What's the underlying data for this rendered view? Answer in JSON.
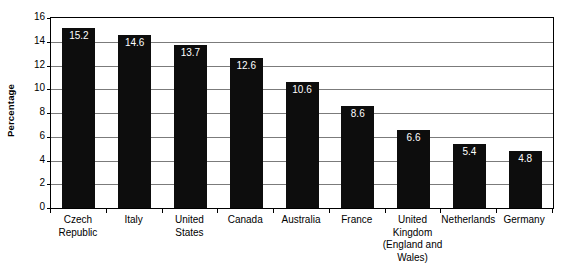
{
  "chart_data": {
    "type": "bar",
    "title": "",
    "subtitle": "",
    "xlabel": "",
    "ylabel": "Percentage",
    "ylim": [
      0,
      16
    ],
    "ytick_step": 2,
    "grid": true,
    "legend": "none",
    "orientation": "vertical",
    "categories": [
      "Czech Republic",
      "Italy",
      "United States",
      "Canada",
      "Australia",
      "France",
      "United Kingdom (England and Wales)",
      "Netherlands",
      "Germany"
    ],
    "values": [
      15.2,
      14.6,
      13.7,
      12.6,
      10.6,
      8.6,
      6.6,
      5.4,
      4.8
    ],
    "value_labels": [
      "15.2",
      "14.6",
      "13.7",
      "12.6",
      "10.6",
      "8.6",
      "6.6",
      "5.4",
      "4.8"
    ],
    "ytick_labels": [
      "16",
      "14",
      "12",
      "10",
      "8",
      "6",
      "4",
      "2",
      "0"
    ],
    "ytick_values": [
      16,
      14,
      12,
      10,
      8,
      6,
      4,
      2,
      0
    ],
    "category_label_lines": [
      [
        "Czech",
        "Republic"
      ],
      [
        "Italy"
      ],
      [
        "United",
        "States"
      ],
      [
        "Canada"
      ],
      [
        "Australia"
      ],
      [
        "France"
      ],
      [
        "United",
        "Kingdom",
        "(England and",
        "Wales)"
      ],
      [
        "Netherlands"
      ],
      [
        "Germany"
      ]
    ],
    "colors": {
      "bar": "#0d0d0d",
      "value_label": "#ffffff",
      "gridline": "#7b7b7b",
      "axis": "#000000",
      "background": "#ffffff",
      "text": "#000000"
    }
  }
}
